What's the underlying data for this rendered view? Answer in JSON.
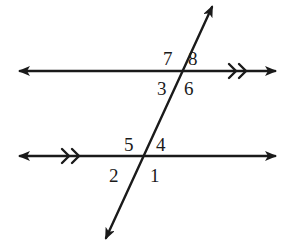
{
  "diagram": {
    "colors": {
      "stroke": "#1a1a1a",
      "background": "#ffffff"
    },
    "lines": [
      {
        "id": "top-parallel-line",
        "y": 71,
        "x1": 18,
        "x2": 277,
        "marker": "double-chevron",
        "marker_x": 230
      },
      {
        "id": "bottom-parallel-line",
        "y": 156,
        "x1": 18,
        "x2": 277,
        "marker": "double-chevron",
        "marker_x": 62
      },
      {
        "id": "transversal",
        "x1": 105,
        "y1": 240,
        "x2": 213,
        "y2": 5
      }
    ],
    "angles": {
      "a1": "1",
      "a2": "2",
      "a3": "3",
      "a4": "4",
      "a5": "5",
      "a6": "6",
      "a7": "7",
      "a8": "8"
    }
  }
}
